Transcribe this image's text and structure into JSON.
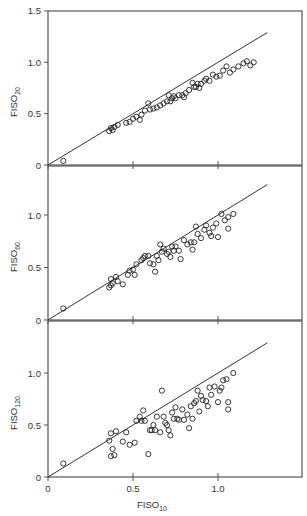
{
  "figure": {
    "x_axis_label": "FISO",
    "x_axis_subscript": "10"
  },
  "chart_data": [
    {
      "type": "scatter",
      "title": "",
      "xlabel": "FISO10",
      "ylabel": "FISO20",
      "ylabel_main": "FISO",
      "ylabel_sub": "20",
      "xlim": [
        0,
        1.5
      ],
      "ylim": [
        0,
        1.5
      ],
      "xticks": [
        0,
        0.5,
        1.0
      ],
      "yticks": [
        0,
        0.5,
        1.0,
        1.5
      ],
      "ytick_labels": [
        "0",
        "0.5",
        "1.0",
        "1.5"
      ],
      "show_x_tick_labels": false,
      "grid": false,
      "reference_line": {
        "x": [
          0,
          1.29
        ],
        "y": [
          0,
          1.29
        ]
      },
      "points": [
        [
          0.09,
          0.04
        ],
        [
          0.36,
          0.33
        ],
        [
          0.37,
          0.36
        ],
        [
          0.38,
          0.34
        ],
        [
          0.39,
          0.37
        ],
        [
          0.41,
          0.39
        ],
        [
          0.46,
          0.41
        ],
        [
          0.48,
          0.42
        ],
        [
          0.5,
          0.45
        ],
        [
          0.52,
          0.47
        ],
        [
          0.54,
          0.44
        ],
        [
          0.55,
          0.49
        ],
        [
          0.57,
          0.53
        ],
        [
          0.59,
          0.6
        ],
        [
          0.6,
          0.54
        ],
        [
          0.62,
          0.55
        ],
        [
          0.64,
          0.56
        ],
        [
          0.66,
          0.58
        ],
        [
          0.68,
          0.6
        ],
        [
          0.7,
          0.62
        ],
        [
          0.71,
          0.68
        ],
        [
          0.72,
          0.62
        ],
        [
          0.73,
          0.65
        ],
        [
          0.74,
          0.67
        ],
        [
          0.75,
          0.65
        ],
        [
          0.77,
          0.68
        ],
        [
          0.79,
          0.68
        ],
        [
          0.8,
          0.66
        ],
        [
          0.81,
          0.7
        ],
        [
          0.83,
          0.73
        ],
        [
          0.85,
          0.8
        ],
        [
          0.86,
          0.76
        ],
        [
          0.87,
          0.76
        ],
        [
          0.88,
          0.79
        ],
        [
          0.89,
          0.75
        ],
        [
          0.9,
          0.79
        ],
        [
          0.92,
          0.82
        ],
        [
          0.93,
          0.84
        ],
        [
          0.95,
          0.82
        ],
        [
          0.97,
          0.88
        ],
        [
          0.99,
          0.86
        ],
        [
          1.01,
          0.87
        ],
        [
          1.03,
          0.92
        ],
        [
          1.05,
          0.96
        ],
        [
          1.07,
          0.9
        ],
        [
          1.09,
          0.93
        ],
        [
          1.12,
          0.96
        ],
        [
          1.15,
          0.99
        ],
        [
          1.17,
          1.01
        ],
        [
          1.19,
          0.97
        ],
        [
          1.21,
          1.0
        ]
      ]
    },
    {
      "type": "scatter",
      "title": "",
      "xlabel": "FISO10",
      "ylabel": "FISO60",
      "ylabel_main": "FISO",
      "ylabel_sub": "60",
      "xlim": [
        0,
        1.5
      ],
      "ylim": [
        0,
        1.0
      ],
      "xticks": [
        0,
        0.5,
        1.0
      ],
      "yticks": [
        0,
        0.5,
        1.0
      ],
      "ytick_labels": [
        "0",
        "0.5",
        "1.0"
      ],
      "show_x_tick_labels": false,
      "grid": false,
      "reference_line": {
        "x": [
          0,
          1.29
        ],
        "y": [
          0,
          1.29
        ]
      },
      "points": [
        [
          0.09,
          0.11
        ],
        [
          0.36,
          0.31
        ],
        [
          0.37,
          0.33
        ],
        [
          0.37,
          0.39
        ],
        [
          0.38,
          0.35
        ],
        [
          0.4,
          0.41
        ],
        [
          0.41,
          0.37
        ],
        [
          0.44,
          0.34
        ],
        [
          0.47,
          0.43
        ],
        [
          0.48,
          0.47
        ],
        [
          0.5,
          0.48
        ],
        [
          0.51,
          0.43
        ],
        [
          0.52,
          0.53
        ],
        [
          0.55,
          0.57
        ],
        [
          0.56,
          0.59
        ],
        [
          0.57,
          0.61
        ],
        [
          0.59,
          0.61
        ],
        [
          0.6,
          0.54
        ],
        [
          0.62,
          0.53
        ],
        [
          0.63,
          0.46
        ],
        [
          0.64,
          0.61
        ],
        [
          0.65,
          0.57
        ],
        [
          0.66,
          0.72
        ],
        [
          0.67,
          0.65
        ],
        [
          0.68,
          0.68
        ],
        [
          0.7,
          0.63
        ],
        [
          0.71,
          0.65
        ],
        [
          0.72,
          0.6
        ],
        [
          0.73,
          0.7
        ],
        [
          0.74,
          0.66
        ],
        [
          0.75,
          0.7
        ],
        [
          0.77,
          0.66
        ],
        [
          0.78,
          0.58
        ],
        [
          0.8,
          0.76
        ],
        [
          0.82,
          0.72
        ],
        [
          0.84,
          0.74
        ],
        [
          0.85,
          0.67
        ],
        [
          0.86,
          0.74
        ],
        [
          0.87,
          0.89
        ],
        [
          0.88,
          0.82
        ],
        [
          0.9,
          0.78
        ],
        [
          0.92,
          0.86
        ],
        [
          0.93,
          0.9
        ],
        [
          0.95,
          0.83
        ],
        [
          0.96,
          0.8
        ],
        [
          0.97,
          0.88
        ],
        [
          0.99,
          0.92
        ],
        [
          1.0,
          0.79
        ],
        [
          1.02,
          1.01
        ],
        [
          1.04,
          0.95
        ],
        [
          1.06,
          0.98
        ],
        [
          1.06,
          0.87
        ],
        [
          1.09,
          1.01
        ]
      ]
    },
    {
      "type": "scatter",
      "title": "",
      "xlabel": "FISO10",
      "ylabel": "FISO120",
      "ylabel_main": "FISO",
      "ylabel_sub": "120",
      "xlim": [
        0,
        1.5
      ],
      "ylim": [
        0,
        1.0
      ],
      "xticks": [
        0,
        0.5,
        1.0
      ],
      "yticks": [
        0,
        0.5,
        1.0
      ],
      "ytick_labels": [
        "0",
        "0.5",
        "1.0"
      ],
      "xtick_labels": [
        "0",
        "0.5",
        "1.0"
      ],
      "show_x_tick_labels": true,
      "grid": false,
      "reference_line": {
        "x": [
          0,
          1.29
        ],
        "y": [
          0,
          1.29
        ]
      },
      "points": [
        [
          0.09,
          0.13
        ],
        [
          0.36,
          0.35
        ],
        [
          0.37,
          0.42
        ],
        [
          0.37,
          0.2
        ],
        [
          0.38,
          0.27
        ],
        [
          0.39,
          0.21
        ],
        [
          0.4,
          0.44
        ],
        [
          0.44,
          0.34
        ],
        [
          0.46,
          0.43
        ],
        [
          0.48,
          0.31
        ],
        [
          0.51,
          0.33
        ],
        [
          0.52,
          0.54
        ],
        [
          0.54,
          0.58
        ],
        [
          0.55,
          0.54
        ],
        [
          0.56,
          0.64
        ],
        [
          0.57,
          0.54
        ],
        [
          0.59,
          0.22
        ],
        [
          0.6,
          0.45
        ],
        [
          0.61,
          0.45
        ],
        [
          0.62,
          0.5
        ],
        [
          0.63,
          0.45
        ],
        [
          0.64,
          0.58
        ],
        [
          0.66,
          0.43
        ],
        [
          0.67,
          0.83
        ],
        [
          0.68,
          0.58
        ],
        [
          0.69,
          0.52
        ],
        [
          0.7,
          0.5
        ],
        [
          0.71,
          0.45
        ],
        [
          0.72,
          0.4
        ],
        [
          0.73,
          0.62
        ],
        [
          0.74,
          0.56
        ],
        [
          0.75,
          0.67
        ],
        [
          0.76,
          0.56
        ],
        [
          0.77,
          0.55
        ],
        [
          0.79,
          0.65
        ],
        [
          0.8,
          0.55
        ],
        [
          0.82,
          0.6
        ],
        [
          0.83,
          0.47
        ],
        [
          0.84,
          0.68
        ],
        [
          0.85,
          0.56
        ],
        [
          0.86,
          0.71
        ],
        [
          0.87,
          0.73
        ],
        [
          0.88,
          0.83
        ],
        [
          0.89,
          0.63
        ],
        [
          0.9,
          0.78
        ],
        [
          0.91,
          0.74
        ],
        [
          0.93,
          0.73
        ],
        [
          0.94,
          0.68
        ],
        [
          0.95,
          0.86
        ],
        [
          0.96,
          0.79
        ],
        [
          0.98,
          0.87
        ],
        [
          1.0,
          0.72
        ],
        [
          1.01,
          0.83
        ],
        [
          1.02,
          0.86
        ],
        [
          1.03,
          0.93
        ],
        [
          1.05,
          0.94
        ],
        [
          1.06,
          0.65
        ],
        [
          1.06,
          0.72
        ],
        [
          1.09,
          1.0
        ]
      ]
    }
  ]
}
